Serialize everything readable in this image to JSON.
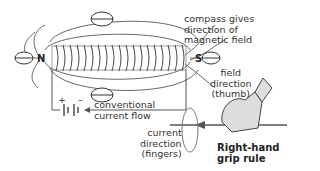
{
  "diagram": {
    "pole_north": "N",
    "pole_south": "S",
    "battery_plus": "+",
    "battery_minus": "–",
    "labels": {
      "compass": [
        "compass gives",
        "direction of",
        "magnetic field"
      ],
      "current_flow": [
        "conventional",
        "current flow"
      ],
      "field_direction": [
        "field",
        "direction",
        "(thumb)"
      ],
      "current_direction": [
        "current",
        "direction",
        "(fingers)"
      ],
      "rule": [
        "Right-hand",
        "grip rule"
      ]
    },
    "colors": {
      "line": "#555555",
      "coil": "#666666",
      "hand_fill": "#dddddd",
      "text": "#333333"
    }
  }
}
